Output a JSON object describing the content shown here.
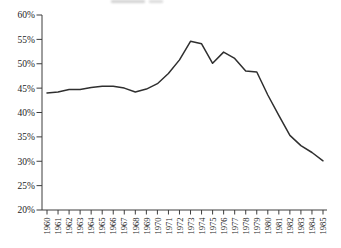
{
  "page": {
    "background_color": "#ffffff"
  },
  "chart_data": {
    "type": "line",
    "title": "",
    "xlabel": "",
    "ylabel": "",
    "grid": false,
    "legend": "none",
    "ylim": [
      20,
      60
    ],
    "x": [
      "1960",
      "1961",
      "1962",
      "1963",
      "1964",
      "1965",
      "1966",
      "1967",
      "1968",
      "1969",
      "1970",
      "1971",
      "1972",
      "1973",
      "1974",
      "1975",
      "1976",
      "1977",
      "1978",
      "1979",
      "1980",
      "1981",
      "1982",
      "1983",
      "1984",
      "1985"
    ],
    "values": [
      44.0,
      44.2,
      44.7,
      44.7,
      45.1,
      45.4,
      45.4,
      45.0,
      44.2,
      44.8,
      45.9,
      48.0,
      50.8,
      54.6,
      54.1,
      50.1,
      52.4,
      51.1,
      48.5,
      48.3,
      43.6,
      39.4,
      35.3,
      33.2,
      31.8,
      30.1
    ],
    "y_ticks": [
      {
        "value": 60,
        "label": "60%"
      },
      {
        "value": 55,
        "label": "55%"
      },
      {
        "value": 50,
        "label": "50%"
      },
      {
        "value": 45,
        "label": "45%"
      },
      {
        "value": 40,
        "label": "40%"
      },
      {
        "value": 35,
        "label": "35%"
      },
      {
        "value": 30,
        "label": "30%"
      },
      {
        "value": 25,
        "label": "25%"
      },
      {
        "value": 20,
        "label": "20%"
      }
    ],
    "colors": {
      "line": "#2f2f2f",
      "axis": "#3d3d3d",
      "text": "#1c1c1c"
    }
  }
}
